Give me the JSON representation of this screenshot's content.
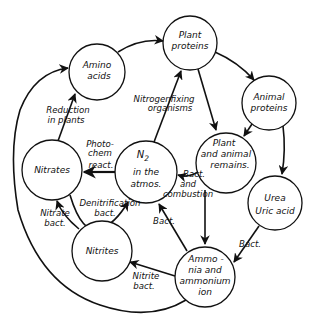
{
  "diagram": {
    "nodes": {
      "amino_acids": {
        "line1": "Amino",
        "line2": "acids"
      },
      "plant_proteins": {
        "line1": "Plant",
        "line2": "proteins"
      },
      "animal_proteins": {
        "line1": "Animal",
        "line2": "proteins"
      },
      "remains": {
        "line1": "Plant",
        "line2": "and animal",
        "line3": "remains."
      },
      "n2": {
        "line1": "N",
        "sub": "2",
        "line2": "in the",
        "line3": "atmos."
      },
      "nitrates": {
        "line1": "Nitrates"
      },
      "nitrites": {
        "line1": "Nitrites"
      },
      "urea": {
        "line1": "Urea",
        "line2": "Uric acid"
      },
      "ammonia": {
        "line1": "Ammo -",
        "line2": "nia and",
        "line3": "ammonium",
        "line4": "ion"
      }
    },
    "edges": {
      "reduction": {
        "line1": "Reduction",
        "line2": "in plants"
      },
      "nitrogen_fixing": {
        "line1": "Nitrogenfixing",
        "line2": "organisms"
      },
      "photochem": {
        "line1": "Photo-",
        "line2": "chem",
        "line3": "react."
      },
      "denitrification": {
        "line1": "Denitrification",
        "line2": "bact."
      },
      "nitrate_bact": {
        "line1": "Nitrate",
        "line2": "bact."
      },
      "bact_combustion": {
        "line1": "Bact.",
        "line2": "and",
        "line3": "combustion"
      },
      "bact_ammonia_n2": {
        "line1": "Bact."
      },
      "bact_urea": {
        "line1": "Bact."
      },
      "nitrite_bact": {
        "line1": "Nitrite",
        "line2": "bact."
      }
    }
  }
}
